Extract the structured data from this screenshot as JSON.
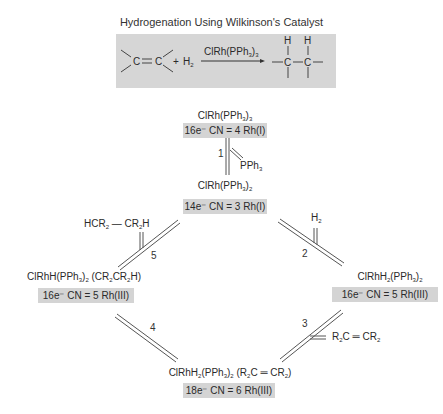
{
  "title": "Hydrogenation Using Wilkinson's Catalyst",
  "overall_reaction": {
    "reactant_alkene": "C = C",
    "plus": "+",
    "reactant_h2": "H2",
    "catalyst_over_arrow": "ClRh(PPh3)3",
    "product": "H-C-C-H (alkane, H atoms added across former double bond)",
    "product_h_labels": [
      "H",
      "H"
    ],
    "product_c_labels": [
      "C",
      "C"
    ]
  },
  "cycle": {
    "species": [
      {
        "id": "s0",
        "formula": "ClRh(PPh3)3",
        "electron_count": "16e⁻ CN = 4 Rh(I)"
      },
      {
        "id": "s1",
        "formula": "ClRh(PPh3)2",
        "electron_count": "14e⁻ CN = 3 Rh(I)"
      },
      {
        "id": "s2",
        "formula": "ClRhH2(PPh3)2",
        "electron_count": "16e⁻ CN = 5 Rh(III)"
      },
      {
        "id": "s3",
        "formula": "ClRhH2(PPh3)2 (R2C = CR2)",
        "electron_count": "18e⁻ CN = 6 Rh(III)"
      },
      {
        "id": "s4",
        "formula": "ClRhH(PPh3)2 (CR2CR2H)",
        "electron_count": "16e⁻ CN = 5 Rh(III)"
      }
    ],
    "steps": [
      {
        "number": "1",
        "from": "s0",
        "to": "s1",
        "side_species": "PPh3",
        "direction": "released"
      },
      {
        "number": "2",
        "from": "s1",
        "to": "s2",
        "side_species": "H2",
        "direction": "added"
      },
      {
        "number": "3",
        "from": "s2",
        "to": "s3",
        "side_species": "R2C = CR2",
        "direction": "added"
      },
      {
        "number": "4",
        "from": "s3",
        "to": "s4",
        "side_species": "",
        "direction": ""
      },
      {
        "number": "5",
        "from": "s4",
        "to": "s1",
        "side_species": "HCR2 — CR2H",
        "direction": "released"
      }
    ]
  },
  "colors": {
    "box_fill": "#d4d4d4",
    "text": "#2a2a2a",
    "line": "#555555"
  }
}
